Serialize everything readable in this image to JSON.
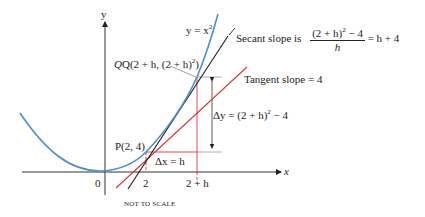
{
  "figure": {
    "axes": {
      "x_label": "x",
      "y_label": "y",
      "origin_label": "0"
    },
    "ticks": {
      "x1": "2",
      "x2": "2 + h"
    },
    "curve_label": {
      "prefix": "y = x",
      "exp": "2"
    },
    "point_P": "P(2, 4)",
    "point_Q": {
      "text": "Q(2 + h, (2 + h)",
      "exp": "2",
      "close": ")"
    },
    "secant": {
      "prefix": "Secant slope is",
      "numerator": "(2 + h)",
      "numerator_exp": "2",
      "numerator_tail": " − 4",
      "denominator": "h",
      "result": "= h + 4"
    },
    "tangent": "Tangent slope = 4",
    "delta_x": "Δx = h",
    "delta_y": {
      "text": "Δy = (2 + h)",
      "exp": "2",
      "tail": " − 4"
    },
    "note": "NOT TO SCALE",
    "colors": {
      "curve": "#4a90d0",
      "secant": "#1a1a1a",
      "tangent": "#d9343a",
      "guides": "#d9343a",
      "axes": "#333333",
      "leader": "#888888"
    }
  }
}
